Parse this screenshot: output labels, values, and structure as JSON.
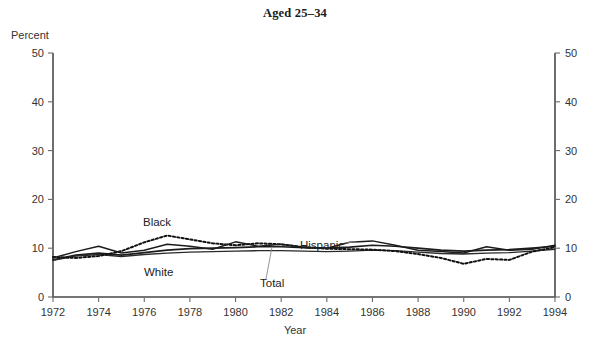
{
  "chart_data": {
    "type": "line",
    "title": "Aged 25–34",
    "xlabel": "Year",
    "ylabel": "Percent",
    "ylim": [
      0,
      50
    ],
    "xlim": [
      1972,
      1994
    ],
    "ytick_labels": [
      "0",
      "10",
      "20",
      "30",
      "40",
      "50"
    ],
    "ytick_values": [
      0,
      10,
      20,
      30,
      40,
      50
    ],
    "xtick_labels": [
      "1972",
      "1974",
      "1976",
      "1978",
      "1980",
      "1982",
      "1984",
      "1986",
      "1988",
      "1990",
      "1992",
      "1994"
    ],
    "xtick_values": [
      1972,
      1974,
      1976,
      1978,
      1980,
      1982,
      1984,
      1986,
      1988,
      1990,
      1992,
      1994
    ],
    "grid": false,
    "legend_position": "inline-annotations",
    "dual_y_axis": true,
    "x": [
      1972,
      1973,
      1974,
      1975,
      1976,
      1977,
      1978,
      1979,
      1980,
      1981,
      1982,
      1983,
      1984,
      1985,
      1986,
      1987,
      1988,
      1989,
      1990,
      1991,
      1992,
      1993,
      1994
    ],
    "series": [
      {
        "name": "Total",
        "style": "solid",
        "values": [
          7.6,
          8.6,
          9.0,
          8.6,
          9.1,
          9.6,
          9.9,
          10.0,
          10.1,
          10.3,
          10.3,
          10.1,
          10.0,
          10.2,
          10.6,
          10.4,
          10.0,
          9.6,
          9.4,
          9.6,
          9.7,
          10.0,
          10.4
        ]
      },
      {
        "name": "White",
        "style": "solid",
        "values": [
          7.5,
          8.4,
          8.7,
          8.3,
          8.7,
          9.0,
          9.2,
          9.3,
          9.4,
          9.5,
          9.5,
          9.4,
          9.3,
          9.4,
          9.6,
          9.5,
          9.2,
          8.9,
          8.8,
          9.0,
          9.1,
          9.4,
          9.8
        ]
      },
      {
        "name": "Black",
        "style": "dotted",
        "values": [
          8.2,
          8.0,
          8.4,
          9.4,
          11.2,
          12.6,
          11.8,
          11.0,
          10.6,
          11.0,
          10.8,
          10.2,
          9.9,
          9.8,
          9.7,
          9.4,
          8.8,
          8.0,
          6.8,
          7.8,
          7.6,
          9.3,
          10.2
        ]
      },
      {
        "name": "Hispanic",
        "style": "solid",
        "values": [
          8.0,
          9.3,
          10.4,
          9.0,
          9.6,
          10.8,
          10.4,
          9.8,
          11.3,
          10.4,
          10.8,
          10.2,
          10.0,
          11.2,
          11.5,
          10.6,
          9.6,
          9.3,
          9.0,
          10.3,
          9.6,
          9.8,
          10.6
        ]
      }
    ],
    "annotations": [
      {
        "text": "Black",
        "x_px": 143,
        "y_px": 226
      },
      {
        "text": "White",
        "x_px": 144,
        "y_px": 276
      },
      {
        "text": "Hispanic",
        "x_px": 300,
        "y_px": 249
      },
      {
        "text": "Total",
        "x_px": 260,
        "y_px": 287
      }
    ]
  }
}
